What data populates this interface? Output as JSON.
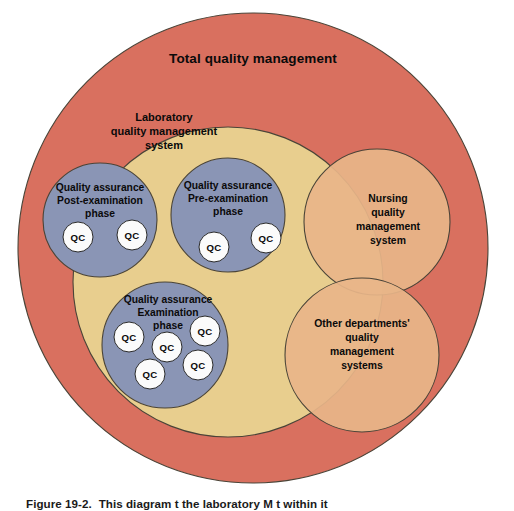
{
  "figure": {
    "title": "Total quality management",
    "background_color": "#ffffff",
    "width": 514,
    "height": 506
  },
  "palette": {
    "total_quality_red": "#d9705f",
    "laboratory_yellow": "#e8ce8e",
    "quality_assurance_blue": "#8a95b5",
    "other_system_orange": "#e8b589",
    "qc_white": "#fbfbfb",
    "outline": "#4a4438",
    "text": "#0a0a0a"
  },
  "circles": {
    "total_quality_management": {
      "label": "Total quality management",
      "label_lines": [
        "Total quality management"
      ],
      "color": "#d9705f",
      "cx": 253,
      "cy": 248,
      "r": 235,
      "label_cx": 253,
      "label_cy": 59
    },
    "laboratory_quality_management_system": {
      "label": "Laboratory quality management system",
      "label_lines": [
        "Laboratory",
        "quality management",
        "system"
      ],
      "color": "#e8ce8e",
      "cx": 228,
      "cy": 282,
      "r": 155,
      "label_cx": 164,
      "label_cy": 126
    },
    "nursing_quality_management_system": {
      "label": "Nursing quality management system",
      "label_lines": [
        "Nursing",
        "quality",
        "management",
        "system"
      ],
      "color": "#e8b589",
      "cx": 377,
      "cy": 222,
      "r": 73,
      "label_cx": 388,
      "label_cy": 216
    },
    "other_departments_quality_management_systems": {
      "label": "Other departments' quality management systems",
      "label_lines": [
        "Other departments'",
        "quality",
        "management",
        "systems"
      ],
      "color": "#e8b589",
      "cx": 362,
      "cy": 355,
      "r": 77,
      "label_cx": 362,
      "label_cy": 345
    },
    "quality_assurance_post_examination": {
      "label": "Quality assurance Post-examination phase",
      "label_lines": [
        "Quality assurance",
        "Post-examination",
        "phase"
      ],
      "color": "#8a95b5",
      "cx": 100,
      "cy": 220,
      "r": 57,
      "label_cx": 100,
      "label_cy": 199
    },
    "quality_assurance_pre_examination": {
      "label": "Quality assurance Pre-examination phase",
      "label_lines": [
        "Quality assurance",
        "Pre-examination",
        "phase"
      ],
      "color": "#8a95b5",
      "cx": 228,
      "cy": 215,
      "r": 57,
      "label_cx": 228,
      "label_cy": 196
    },
    "quality_assurance_examination": {
      "label": "Quality assurance Examination phase",
      "label_lines": [
        "Quality assurance",
        "Examination",
        "phase"
      ],
      "color": "#8a95b5",
      "cx": 165,
      "cy": 345,
      "r": 63,
      "label_cx": 168,
      "label_cy": 312
    }
  },
  "qc_label": "QC",
  "qc_bubbles": {
    "post_examination": [
      {
        "cx": 78,
        "cy": 237,
        "r": 15
      },
      {
        "cx": 132,
        "cy": 235,
        "r": 15
      },
      {
        "cx": 0,
        "cy": 0,
        "r": 0
      }
    ],
    "pre_examination": [
      {
        "cx": 214,
        "cy": 247,
        "r": 15
      },
      {
        "cx": 266,
        "cy": 238,
        "r": 15
      }
    ],
    "examination": [
      {
        "cx": 129,
        "cy": 337,
        "r": 15
      },
      {
        "cx": 167,
        "cy": 347,
        "r": 15
      },
      {
        "cx": 205,
        "cy": 331,
        "r": 15
      },
      {
        "cx": 150,
        "cy": 374,
        "r": 15
      },
      {
        "cx": 198,
        "cy": 365,
        "r": 15
      }
    ]
  },
  "caption": {
    "label": "Figure 19-2.",
    "text": "This diagram  t   the laboratory  M   t    within it"
  }
}
